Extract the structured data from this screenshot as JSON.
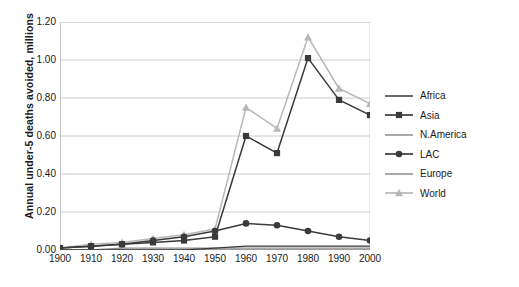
{
  "chart_data": {
    "type": "line",
    "title": "",
    "subtitle": "",
    "xlabel": "",
    "ylabel": "Annual under-5 deaths avoided, millions",
    "categories": [
      "1900",
      "1910",
      "1920",
      "1930",
      "1940",
      "1950",
      "1960",
      "1970",
      "1980",
      "1990",
      "2000"
    ],
    "x": [
      1900,
      1910,
      1920,
      1930,
      1940,
      1950,
      1960,
      1970,
      1980,
      1990,
      2000
    ],
    "xlim": [
      1900,
      2000
    ],
    "ylim": [
      0.0,
      1.2
    ],
    "yticks": [
      "0.00",
      "0.20",
      "0.40",
      "0.60",
      "0.80",
      "1.00",
      "1.20"
    ],
    "ytick_values": [
      0.0,
      0.2,
      0.4,
      0.6,
      0.8,
      1.0,
      1.2
    ],
    "grid": "horizontal",
    "legend_position": "right",
    "series": [
      {
        "name": "Africa",
        "color": "#3a3a3a",
        "marker": "none",
        "width": 1.3,
        "values": [
          0.0,
          0.0,
          0.0,
          0.0,
          0.0,
          0.01,
          0.02,
          0.02,
          0.02,
          0.02,
          0.02
        ]
      },
      {
        "name": "Asia",
        "color": "#3a3a3a",
        "marker": "square",
        "width": 1.5,
        "values": [
          0.01,
          0.02,
          0.03,
          0.04,
          0.05,
          0.07,
          0.6,
          0.51,
          1.01,
          0.79,
          0.71
        ]
      },
      {
        "name": "N.America",
        "color": "#8c8c8c",
        "marker": "none",
        "width": 1.3,
        "values": [
          0.0,
          0.0,
          0.01,
          0.01,
          0.01,
          0.01,
          0.01,
          0.01,
          0.01,
          0.01,
          0.01
        ]
      },
      {
        "name": "LAC",
        "color": "#3a3a3a",
        "marker": "circle",
        "width": 1.5,
        "values": [
          0.01,
          0.02,
          0.03,
          0.05,
          0.07,
          0.1,
          0.14,
          0.13,
          0.1,
          0.07,
          0.05
        ]
      },
      {
        "name": "Europe",
        "color": "#8c8c8c",
        "marker": "none",
        "width": 1.3,
        "values": [
          0.0,
          0.0,
          0.0,
          0.0,
          0.0,
          0.0,
          0.0,
          0.0,
          0.0,
          0.0,
          0.0
        ]
      },
      {
        "name": "World",
        "color": "#b8b8b8",
        "marker": "triangle",
        "width": 1.5,
        "values": [
          0.01,
          0.03,
          0.04,
          0.06,
          0.08,
          0.11,
          0.75,
          0.64,
          1.12,
          0.85,
          0.77
        ]
      }
    ]
  },
  "caption": {
    "text": ""
  }
}
